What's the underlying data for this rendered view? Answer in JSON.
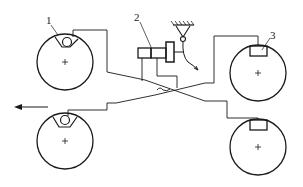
{
  "diagram": {
    "type": "brake-system-schematic",
    "labels": [
      {
        "id": "1",
        "text": "1",
        "target": "caliper-front-left"
      },
      {
        "id": "2",
        "text": "2",
        "target": "master-cylinder"
      },
      {
        "id": "3",
        "text": "3",
        "target": "caliper-rear-right"
      }
    ],
    "direction_arrow": "forward (left)",
    "wheels": [
      {
        "position": "top-left",
        "caliper": "floating"
      },
      {
        "position": "bottom-left",
        "caliper": "floating"
      },
      {
        "position": "top-right",
        "caliper": "fixed"
      },
      {
        "position": "bottom-right",
        "caliper": "fixed"
      }
    ],
    "colors": {
      "line": "#1a1a1a",
      "background": "#ffffff"
    }
  }
}
